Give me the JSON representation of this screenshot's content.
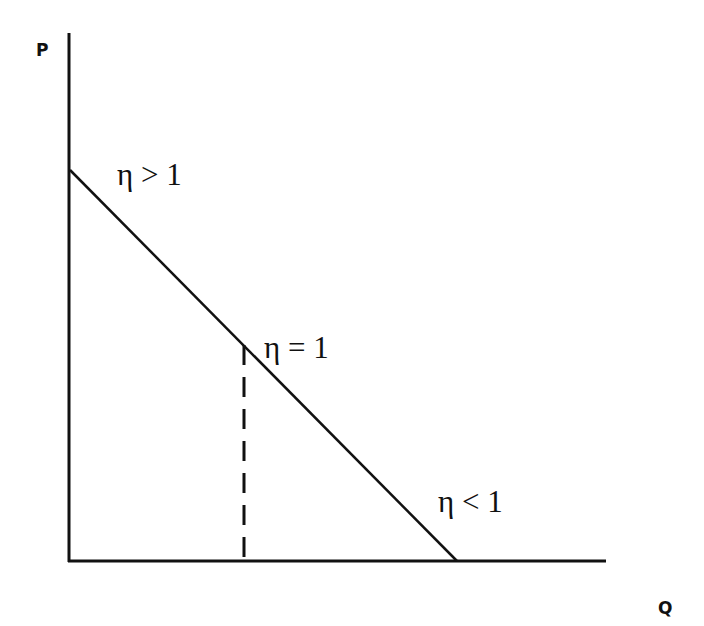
{
  "diagram": {
    "type": "economics-demand-elasticity",
    "axes": {
      "y_label": "P",
      "x_label": "Q"
    },
    "demand_curve": {
      "description": "Linear downward-sloping demand curve",
      "start": "P-intercept",
      "end": "Q-intercept"
    },
    "midpoint_marker": {
      "style": "dashed vertical line from unit-elastic point to Q axis"
    },
    "labels": [
      {
        "id": "elastic",
        "text": "η > 1"
      },
      {
        "id": "unit",
        "text": "η = 1"
      },
      {
        "id": "inelastic",
        "text": "η < 1"
      }
    ],
    "colors": {
      "line": "#111111",
      "background": "#ffffff"
    }
  }
}
